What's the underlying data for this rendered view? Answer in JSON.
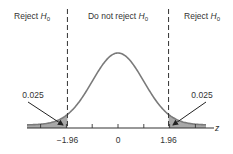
{
  "chart_data": {
    "type": "area",
    "title": "",
    "distribution": "standard normal",
    "xlabel": "z",
    "ylabel": "",
    "xlim": [
      -3.5,
      3.5
    ],
    "mean": 0,
    "sd": 1,
    "critical_values": [
      -1.96,
      1.96
    ],
    "tick_values": [
      -3,
      -2,
      -1,
      0,
      1,
      2,
      3
    ],
    "tick_labels": [
      {
        "value": -1.96,
        "text": "−1.96"
      },
      {
        "value": 0,
        "text": "0"
      },
      {
        "value": 1.96,
        "text": "1.96"
      }
    ],
    "regions": [
      {
        "name": "left-reject",
        "label": "Reject",
        "sub": "H",
        "subscript": "0",
        "from": -3.5,
        "to": -1.96
      },
      {
        "name": "accept",
        "label": "Do not reject",
        "sub": "H",
        "subscript": "0",
        "from": -1.96,
        "to": 1.96
      },
      {
        "name": "right-reject",
        "label": "Reject",
        "sub": "H",
        "subscript": "0",
        "from": 1.96,
        "to": 3.5
      }
    ],
    "tail_areas": [
      {
        "side": "left",
        "value": "0.025"
      },
      {
        "side": "right",
        "value": "0.025"
      }
    ],
    "colors": {
      "curve": "#7a7a7a",
      "shade": "#a8a8a8",
      "axis": "#333333",
      "text": "#333333"
    }
  }
}
